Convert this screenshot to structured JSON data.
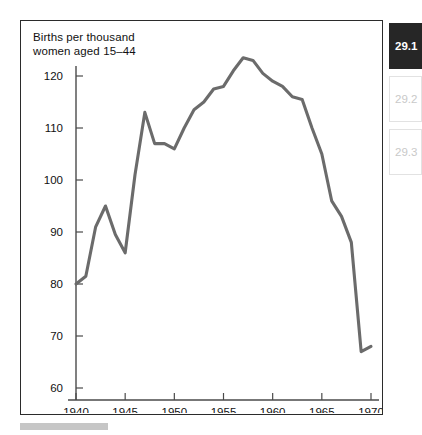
{
  "figure": {
    "title": "Births per thousand\nwomen aged 15–44",
    "frame_color": "#2b2b2b"
  },
  "chart_data": {
    "type": "line",
    "title": "Births per thousand women aged 15–44",
    "xlabel": "",
    "ylabel": "Births per thousand women aged 15–44",
    "xlim": [
      1939,
      1971
    ],
    "ylim": [
      55,
      126
    ],
    "xticks": [
      1940,
      1945,
      1950,
      1955,
      1960,
      1965,
      1970
    ],
    "yticks": [
      60,
      70,
      80,
      90,
      100,
      110,
      120
    ],
    "grid": false,
    "legend": "none",
    "line_color": "#6b6b6b",
    "x": [
      1940,
      1941,
      1942,
      1943,
      1944,
      1945,
      1946,
      1947,
      1948,
      1949,
      1950,
      1951,
      1952,
      1953,
      1954,
      1955,
      1956,
      1957,
      1958,
      1959,
      1960,
      1961,
      1962,
      1963,
      1964,
      1965,
      1966,
      1967,
      1968,
      1969,
      1970
    ],
    "values": [
      80,
      81.5,
      91,
      95,
      89.5,
      86,
      101,
      113,
      107,
      107,
      106,
      110,
      113.5,
      115,
      117.5,
      118,
      121,
      123.5,
      123,
      120.5,
      119,
      118,
      116,
      115.5,
      110,
      105,
      96,
      93,
      88,
      67,
      68
    ],
    "annotations": {
      "wartime_peak_year": 1943,
      "wartime_peak_value": 95,
      "postwar_spike_year": 1947,
      "postwar_spike_value": 113,
      "baby_boom_peak_year": 1957,
      "baby_boom_peak_value": 123.5,
      "end_value": 68
    }
  },
  "section_rail": {
    "items": [
      {
        "label": "29.1",
        "active": true
      },
      {
        "label": "29.2",
        "active": false
      },
      {
        "label": "29.3",
        "active": false
      }
    ]
  }
}
